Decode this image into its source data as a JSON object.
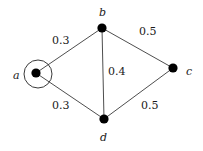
{
  "figure": {
    "type": "weighted-undirected-graph",
    "background_color": "#ffffff",
    "stroke_color": "#3a3a3a",
    "node_color": "#000000",
    "highlight_color": "#3a3a3a",
    "width": 203,
    "height": 151
  },
  "nodes": [
    {
      "id": "a",
      "label": "a",
      "x": 36,
      "y": 73,
      "r": 4.6,
      "highlighted": true,
      "highlight_r": 14,
      "label_x": 13,
      "label_y": 70
    },
    {
      "id": "b",
      "label": "b",
      "x": 102,
      "y": 28,
      "r": 4.6,
      "highlighted": false,
      "label_x": 99,
      "label_y": 7
    },
    {
      "id": "c",
      "label": "c",
      "x": 173,
      "y": 68,
      "r": 4.6,
      "highlighted": false,
      "label_x": 186,
      "label_y": 66
    },
    {
      "id": "d",
      "label": "d",
      "x": 104,
      "y": 119,
      "r": 4.6,
      "highlighted": false,
      "label_x": 100,
      "label_y": 132
    }
  ],
  "edges": [
    {
      "id": "a-b",
      "from": "a",
      "to": "b",
      "weight": "0.3",
      "label_x": 52,
      "label_y": 35
    },
    {
      "id": "a-d",
      "from": "a",
      "to": "d",
      "weight": "0.3",
      "label_x": 52,
      "label_y": 100
    },
    {
      "id": "b-d",
      "from": "b",
      "to": "d",
      "weight": "0.4",
      "label_x": 108,
      "label_y": 66
    },
    {
      "id": "b-c",
      "from": "b",
      "to": "c",
      "weight": "0.5",
      "label_x": 139,
      "label_y": 26
    },
    {
      "id": "d-c",
      "from": "d",
      "to": "c",
      "weight": "0.5",
      "label_x": 141,
      "label_y": 100
    }
  ],
  "chart_data": {
    "type": "diagram",
    "title": "",
    "nodes": [
      "a",
      "b",
      "c",
      "d"
    ],
    "edges": [
      {
        "source": "a",
        "target": "b",
        "weight": 0.3
      },
      {
        "source": "a",
        "target": "d",
        "weight": 0.3
      },
      {
        "source": "b",
        "target": "d",
        "weight": 0.4
      },
      {
        "source": "b",
        "target": "c",
        "weight": 0.5
      },
      {
        "source": "d",
        "target": "c",
        "weight": 0.5
      }
    ],
    "highlighted_nodes": [
      "a"
    ],
    "legend": [],
    "xlabel": "",
    "ylabel": ""
  }
}
